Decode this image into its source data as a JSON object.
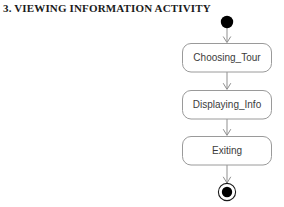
{
  "page": {
    "title": "3. VIEWING INFORMATION ACTIVITY",
    "background_color": "#ffffff",
    "title_color": "#1b1b1b"
  },
  "diagram": {
    "type": "uml-activity-diagram",
    "node_fill_color": "#ffffff",
    "node_border_color": "#9a9a9a",
    "node_text_color": "#3b3b3b",
    "edge_color": "#8f8f8f",
    "terminal_color": "#000000",
    "initial_node": {
      "name": "initial-node",
      "kind": "initial",
      "cx": 227,
      "cy": 22,
      "r": 6.2
    },
    "activities": [
      {
        "name": "activity-choosing-tour",
        "label": "Choosing_Tour",
        "x": 182,
        "y": 43,
        "width": 90,
        "height": 29
      },
      {
        "name": "activity-displaying-info",
        "label": "Displaying_Info",
        "x": 182,
        "y": 90,
        "width": 90,
        "height": 29
      },
      {
        "name": "activity-exiting",
        "label": "Exiting",
        "x": 182,
        "y": 136,
        "width": 90,
        "height": 29
      }
    ],
    "final_node": {
      "name": "final-node",
      "kind": "final",
      "cx": 227,
      "cy": 192,
      "outer_r": 8.6,
      "inner_r": 5.2
    },
    "transitions": [
      {
        "name": "edge-initial-to-choosing-tour",
        "x": 227,
        "y1": 28,
        "y2": 43
      },
      {
        "name": "edge-choosing-tour-to-displaying-info",
        "x": 227,
        "y1": 72,
        "y2": 90
      },
      {
        "name": "edge-displaying-info-to-exiting",
        "x": 227,
        "y1": 119,
        "y2": 136
      },
      {
        "name": "edge-exiting-to-final",
        "x": 227,
        "y1": 165,
        "y2": 183
      }
    ]
  }
}
